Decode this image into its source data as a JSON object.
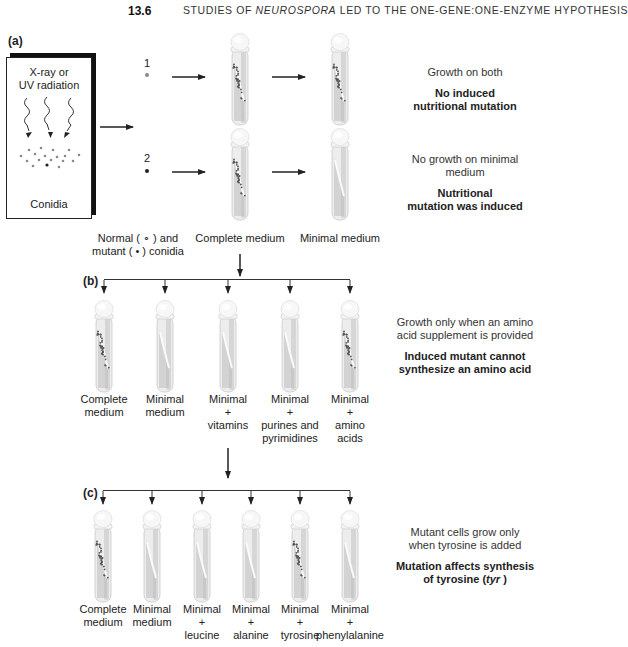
{
  "header": {
    "section_number": "13.6",
    "title_prefix": "STUDIES OF ",
    "title_italic": "NEUROSPORA",
    "title_suffix": " LED TO THE ONE-GENE:ONE-ENZYME HYPOTHESIS"
  },
  "panel_a": {
    "label": "(a)",
    "box_title": "X-ray or UV radiation",
    "box_title_line1": "X-ray or",
    "box_title_line2": "UV radiation",
    "box_caption": "Conidia",
    "conidium_1_number": "1",
    "conidium_2_number": "2",
    "legend_line1": "Normal ( ∘ ) and",
    "legend_line2": "mutant ( • ) conidia",
    "tube_labels": [
      "Complete medium",
      "Minimal medium"
    ],
    "rows": [
      {
        "complete_growth": true,
        "minimal_growth": true,
        "note": "Growth on both",
        "conclusion_line1": "No induced",
        "conclusion_line2": "nutritional mutation"
      },
      {
        "complete_growth": true,
        "minimal_growth": false,
        "note_line1": "No growth on minimal",
        "note_line2": "medium",
        "conclusion_line1": "Nutritional",
        "conclusion_line2": "mutation was induced"
      }
    ]
  },
  "panel_b": {
    "label": "(b)",
    "tubes": [
      {
        "line1": "Complete",
        "line2": "medium",
        "line3": "",
        "line4": "",
        "growth": true
      },
      {
        "line1": "Minimal",
        "line2": "medium",
        "line3": "",
        "line4": "",
        "growth": false
      },
      {
        "line1": "Minimal",
        "line2": "+",
        "line3": "vitamins",
        "line4": "",
        "growth": false
      },
      {
        "line1": "Minimal",
        "line2": "+",
        "line3": "purines and",
        "line4": "pyrimidines",
        "growth": false
      },
      {
        "line1": "Minimal",
        "line2": "+",
        "line3": "amino",
        "line4": "acids",
        "growth": true
      }
    ],
    "note_line1": "Growth only when an amino",
    "note_line2": "acid supplement is provided",
    "conclusion_line1": "Induced mutant cannot",
    "conclusion_line2": "synthesize an amino acid"
  },
  "panel_c": {
    "label": "(c)",
    "tubes": [
      {
        "line1": "Complete",
        "line2": "medium",
        "line3": "",
        "growth": true
      },
      {
        "line1": "Minimal",
        "line2": "medium",
        "line3": "",
        "growth": false
      },
      {
        "line1": "Minimal",
        "line2": "+",
        "line3": "leucine",
        "growth": false
      },
      {
        "line1": "Minimal",
        "line2": "+",
        "line3": "alanine",
        "growth": false
      },
      {
        "line1": "Minimal",
        "line2": "+",
        "line3": "tyrosine",
        "growth": true
      },
      {
        "line1": "Minimal",
        "line2": "+",
        "line3": "phenylalanine",
        "growth": false
      }
    ],
    "note_line1": "Mutant cells grow only",
    "note_line2": "when tyrosine is added",
    "conclusion_line1": "Mutation affects synthesis",
    "conclusion_line2_prefix": "of tyrosine (",
    "conclusion_line2_italic": "tyr",
    "conclusion_line2_suffix": "  )"
  },
  "colors": {
    "ink": "#222222",
    "tube_glass": "#e6e6e6",
    "tube_shade": "#bdbdbd",
    "growth_dots": "#555555",
    "normal_conidium": "#8a8a8a",
    "mutant_conidium": "#222222"
  }
}
